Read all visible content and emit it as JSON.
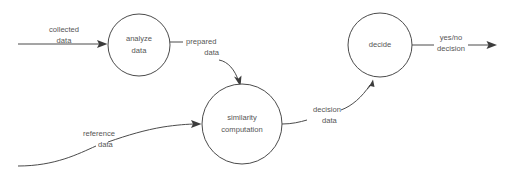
{
  "diagram": {
    "type": "data-flow-diagram",
    "title": "",
    "canvas": {
      "width": 513,
      "height": 173,
      "background": "#ffffff"
    },
    "colors": {
      "stroke": "#4b4b4b",
      "text": "#555555",
      "arrow_fill": "#3c3c3c",
      "node_fill": "#ffffff"
    },
    "processes": [
      {
        "id": "analyze-data",
        "label_line1": "analyze",
        "label_line2": "data",
        "cx": 139,
        "cy": 45,
        "r": 31
      },
      {
        "id": "similarity-computation",
        "label_line1": "similarity",
        "label_line2": "computation",
        "cx": 242,
        "cy": 124,
        "r": 40
      },
      {
        "id": "decide",
        "label_line1": "decide",
        "label_line2": "",
        "cx": 380,
        "cy": 45,
        "r": 32
      }
    ],
    "flows": [
      {
        "id": "collected-data",
        "label_line1": "collected",
        "label_line2": "data",
        "from": "external-source",
        "to": "analyze-data"
      },
      {
        "id": "prepared-data",
        "label_line1": "prepared",
        "label_line2": "data",
        "from": "analyze-data",
        "to": "similarity-computation"
      },
      {
        "id": "reference-data",
        "label_line1": "reference",
        "label_line2": "data",
        "from": "external-source",
        "to": "similarity-computation"
      },
      {
        "id": "decision-data",
        "label_line1": "decision",
        "label_line2": "data",
        "from": "similarity-computation",
        "to": "decide"
      },
      {
        "id": "yesno-decision",
        "label_line1": "yes/no",
        "label_line2": "decision",
        "from": "decide",
        "to": "external-sink"
      }
    ]
  }
}
